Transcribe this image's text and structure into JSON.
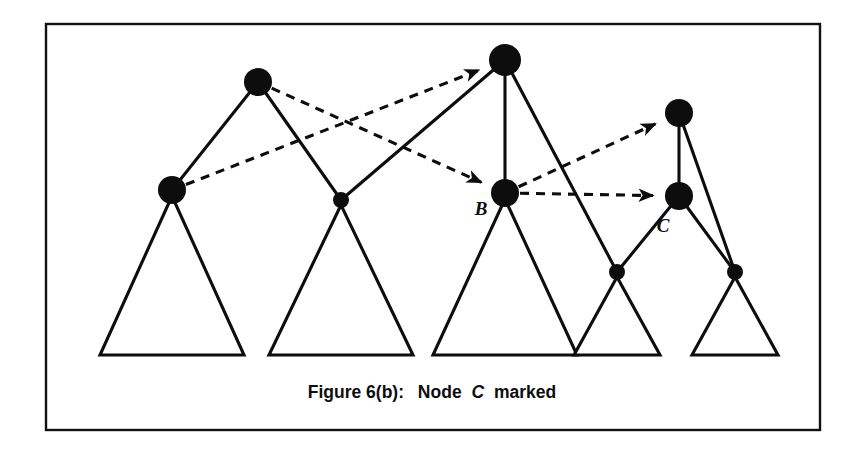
{
  "figure": {
    "caption_prefix": "Figure 6(b):",
    "caption_word_node": "Node",
    "caption_emphasis": "C",
    "caption_suffix": "marked",
    "caption_full": "Figure 6(b):  Node C marked",
    "background_color": "#ffffff",
    "ink_color": "#0d0d0d",
    "frame": {
      "x": 46,
      "y": 24,
      "width": 774,
      "height": 406
    }
  },
  "diagram": {
    "type": "tree-with-pointers",
    "nodes": [
      {
        "id": "n-top-left",
        "label": "",
        "cx": 258,
        "cy": 82,
        "r": 14,
        "size": "large"
      },
      {
        "id": "n-root",
        "label": "",
        "cx": 505,
        "cy": 60,
        "r": 16,
        "size": "large"
      },
      {
        "id": "n-left-low",
        "label": "",
        "cx": 172,
        "cy": 190,
        "r": 14,
        "size": "large"
      },
      {
        "id": "n-mid-small",
        "label": "",
        "cx": 341,
        "cy": 200,
        "r": 8,
        "size": "small"
      },
      {
        "id": "n-b",
        "label": "B",
        "cx": 505,
        "cy": 193,
        "r": 14,
        "size": "large"
      },
      {
        "id": "n-top-right",
        "label": "",
        "cx": 679,
        "cy": 113,
        "r": 14,
        "size": "large"
      },
      {
        "id": "n-c",
        "label": "C",
        "cx": 679,
        "cy": 196,
        "r": 14,
        "size": "large"
      },
      {
        "id": "n-rr-small-l",
        "label": "",
        "cx": 617,
        "cy": 272,
        "r": 8,
        "size": "small"
      },
      {
        "id": "n-rr-small-r",
        "label": "",
        "cx": 735,
        "cy": 272,
        "r": 8,
        "size": "small"
      }
    ],
    "node_labels": [
      {
        "text": "B",
        "x": 481,
        "y": 215
      },
      {
        "text": "C",
        "x": 663,
        "y": 232
      }
    ],
    "tree_edges": [
      {
        "from": "n-top-left",
        "to": "n-left-low"
      },
      {
        "from": "n-top-left",
        "to": "n-mid-small"
      },
      {
        "from": "n-root",
        "to": "n-b"
      },
      {
        "from": "n-root",
        "to": "n-mid-small"
      },
      {
        "from": "n-root",
        "to": "n-rr-small-l"
      },
      {
        "from": "n-top-right",
        "to": "n-c"
      },
      {
        "from": "n-top-right",
        "to": "n-rr-small-r"
      },
      {
        "from": "n-c",
        "to": "n-rr-small-l"
      },
      {
        "from": "n-c",
        "to": "n-rr-small-r"
      }
    ],
    "pointer_arrows": [
      {
        "id": "ptr-leftlow-to-root",
        "from": "n-left-low",
        "to": "n-root",
        "style": "dashed",
        "arrowhead": "at-target"
      },
      {
        "id": "ptr-topleft-to-b",
        "from": "n-top-left",
        "to": "n-b",
        "style": "dashed",
        "arrowhead": "at-target"
      },
      {
        "id": "ptr-b-to-topright",
        "from": "n-b",
        "to": "n-top-right",
        "style": "dashed",
        "arrowhead": "at-target"
      },
      {
        "id": "ptr-b-to-c",
        "from": "n-b",
        "to": "n-c",
        "style": "dashed",
        "arrowhead": "at-target"
      }
    ],
    "triangles": [
      {
        "id": "tri-1",
        "apex_x": 172,
        "apex_y": 196,
        "base_y": 355,
        "half_width": 72
      },
      {
        "id": "tri-2",
        "apex_x": 341,
        "apex_y": 205,
        "base_y": 355,
        "half_width": 72
      },
      {
        "id": "tri-3",
        "apex_x": 505,
        "apex_y": 199,
        "base_y": 355,
        "half_width": 72
      },
      {
        "id": "tri-4",
        "apex_x": 617,
        "apex_y": 277,
        "base_y": 355,
        "half_width": 43
      },
      {
        "id": "tri-5",
        "apex_x": 735,
        "apex_y": 277,
        "base_y": 355,
        "half_width": 43
      }
    ],
    "caption_position": {
      "x": 432,
      "y": 398
    }
  }
}
